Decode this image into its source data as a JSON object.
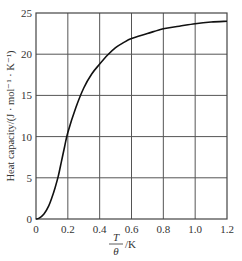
{
  "chart_data": {
    "type": "line",
    "title": "",
    "xlabel": "T/θ /K",
    "xlabel_numerator": "T",
    "xlabel_denominator": "θ",
    "xlabel_unit": "/K",
    "ylabel": "Heat capacity/(J · mol⁻¹ · K⁻¹)",
    "xlim": [
      0,
      1.2
    ],
    "ylim": [
      0,
      25
    ],
    "grid": true,
    "legend": null,
    "x_ticks": [
      "0",
      "0.2",
      "0.4",
      "0.6",
      "0.8",
      "1.0",
      "1.2"
    ],
    "y_ticks": [
      "0",
      "5",
      "10",
      "15",
      "20",
      "25"
    ],
    "series": [
      {
        "name": "Heat capacity",
        "x": [
          0,
          0.02,
          0.05,
          0.08,
          0.1,
          0.12,
          0.14,
          0.16,
          0.18,
          0.2,
          0.25,
          0.3,
          0.35,
          0.4,
          0.45,
          0.5,
          0.55,
          0.6,
          0.7,
          0.8,
          0.9,
          1.0,
          1.1,
          1.2
        ],
        "values": [
          0,
          0.1,
          0.6,
          1.6,
          2.6,
          3.8,
          5.2,
          7.0,
          8.8,
          10.5,
          13.5,
          15.9,
          17.6,
          18.8,
          19.9,
          20.8,
          21.4,
          21.9,
          22.5,
          23.1,
          23.4,
          23.7,
          23.9,
          24.0
        ]
      }
    ],
    "colors": {
      "line": "#111111",
      "grid": "#555555",
      "axis": "#444444"
    }
  }
}
